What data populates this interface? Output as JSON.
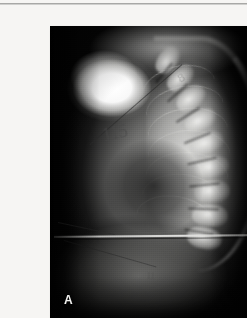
{
  "page": {
    "background_color": "#f6f5f3",
    "rule_color": "#9a9a98"
  },
  "figure": {
    "panel_letter": "A",
    "modality": "x-ray-radiograph",
    "view": "lateral thoracic spine",
    "plate": {
      "x": 10,
      "y": 10,
      "width": 218,
      "height": 293,
      "background_color": "#050505",
      "bone_color": "#f6f6f4",
      "soft_tissue_color": "#9a9a98"
    },
    "regions": [
      {
        "name": "overexposed-shoulder",
        "label": "bright radiopaque shoulder block"
      },
      {
        "name": "thoracic-spine",
        "label": "kyphotic vertebral column"
      },
      {
        "name": "rib-cage",
        "label": "posterior ribs"
      },
      {
        "name": "lung-field",
        "label": "retrocardiac lucency"
      },
      {
        "name": "abdomen",
        "label": "sub-diaphragmatic soft tissue"
      }
    ],
    "annotations": [
      {
        "name": "oblique-measurement-line",
        "type": "line"
      },
      {
        "name": "lower-oblique-line",
        "type": "line"
      },
      {
        "name": "diaphragm-edge-line",
        "type": "line"
      },
      {
        "name": "handwritten-mark-primary",
        "type": "text",
        "text": "115"
      },
      {
        "name": "handwritten-mark-secondary",
        "type": "text",
        "text": "8"
      },
      {
        "name": "handwritten-mark-lower",
        "type": "text",
        "text": "11"
      }
    ],
    "vertebrae": [
      {
        "x": 118,
        "y": 34,
        "w": 30,
        "h": 20,
        "r": -54
      },
      {
        "x": 130,
        "y": 52,
        "w": 31,
        "h": 20,
        "r": -46
      },
      {
        "x": 141,
        "y": 72,
        "w": 32,
        "h": 21,
        "r": -38
      },
      {
        "x": 150,
        "y": 94,
        "w": 33,
        "h": 21,
        "r": -28
      },
      {
        "x": 157,
        "y": 117,
        "w": 34,
        "h": 22,
        "r": -18
      },
      {
        "x": 161,
        "y": 141,
        "w": 35,
        "h": 22,
        "r": -10
      },
      {
        "x": 162,
        "y": 165,
        "w": 36,
        "h": 23,
        "r": -4
      },
      {
        "x": 160,
        "y": 189,
        "w": 36,
        "h": 23,
        "r": 4
      },
      {
        "x": 154,
        "y": 212,
        "w": 35,
        "h": 22,
        "r": 12
      }
    ],
    "ribs": [
      {
        "x": 92,
        "y": 40,
        "w": 74,
        "h": 44,
        "r": -14
      },
      {
        "x": 96,
        "y": 60,
        "w": 78,
        "h": 46,
        "r": -10
      },
      {
        "x": 98,
        "y": 82,
        "w": 80,
        "h": 48,
        "r": -6
      },
      {
        "x": 98,
        "y": 104,
        "w": 82,
        "h": 50,
        "r": -2
      },
      {
        "x": 96,
        "y": 126,
        "w": 82,
        "h": 50,
        "r": 2
      },
      {
        "x": 92,
        "y": 148,
        "w": 80,
        "h": 50,
        "r": 6
      },
      {
        "x": 86,
        "y": 170,
        "w": 78,
        "h": 48,
        "r": 10
      }
    ],
    "discs": [
      {
        "x": 114,
        "y": 46,
        "w": 26,
        "r": -50
      },
      {
        "x": 127,
        "y": 66,
        "w": 27,
        "r": -42
      },
      {
        "x": 138,
        "y": 88,
        "w": 28,
        "r": -32
      },
      {
        "x": 147,
        "y": 111,
        "w": 29,
        "r": -22
      },
      {
        "x": 152,
        "y": 134,
        "w": 30,
        "r": -13
      },
      {
        "x": 154,
        "y": 158,
        "w": 31,
        "r": -6
      },
      {
        "x": 153,
        "y": 182,
        "w": 31,
        "r": 2
      },
      {
        "x": 149,
        "y": 205,
        "w": 30,
        "r": 10
      }
    ]
  }
}
